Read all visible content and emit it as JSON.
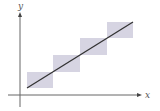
{
  "diagram": {
    "axes": {
      "x_label": "x",
      "y_label": "y",
      "x_axis": {
        "x1": 8,
        "x2": 142,
        "y": 95
      },
      "y_axis": {
        "x": 20,
        "y1": 107,
        "y2": 12
      }
    },
    "line": {
      "x1": 27,
      "y1": 88,
      "x2": 133,
      "y2": 22,
      "color": "#333333"
    },
    "boxes": [
      {
        "x": 27,
        "y": 72,
        "w": 26,
        "h": 16
      },
      {
        "x": 53,
        "y": 55,
        "w": 27,
        "h": 17
      },
      {
        "x": 80,
        "y": 38,
        "w": 27,
        "h": 17
      },
      {
        "x": 107,
        "y": 22,
        "w": 26,
        "h": 16
      }
    ],
    "colors": {
      "box_fill": "#d6d4e2",
      "axis": "#666666",
      "line": "#333333"
    }
  }
}
